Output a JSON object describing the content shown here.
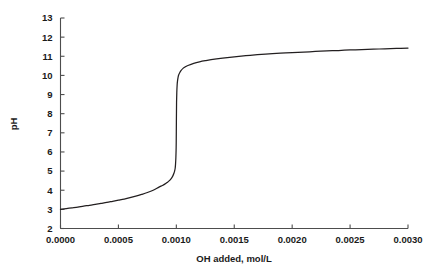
{
  "chart_data": {
    "type": "line",
    "title": "",
    "subtitle": "",
    "xlabel": "OH added, mol/L",
    "ylabel": "pH",
    "xlim": [
      0.0,
      0.003
    ],
    "ylim": [
      2,
      13
    ],
    "grid": false,
    "legend": null,
    "annotations": [],
    "xticks": [
      0.0,
      0.0005,
      0.001,
      0.0015,
      0.002,
      0.0025,
      0.003
    ],
    "xticklabels": [
      "0.0000",
      "0.0005",
      "0.0010",
      "0.0015",
      "0.0020",
      "0.0025",
      "0.0030"
    ],
    "yticks": [
      2,
      3,
      4,
      5,
      6,
      7,
      8,
      9,
      10,
      11,
      12,
      13
    ],
    "yticklabels": [
      "2",
      "3",
      "4",
      "5",
      "6",
      "7",
      "8",
      "9",
      "10",
      "11",
      "12",
      "13"
    ],
    "series": [
      {
        "name": "titration-curve",
        "color": "#231f20",
        "x": [
          0.0,
          5e-05,
          0.0001,
          0.00015,
          0.0002,
          0.00025,
          0.0003,
          0.00035,
          0.0004,
          0.00045,
          0.0005,
          0.00055,
          0.0006,
          0.00065,
          0.0007,
          0.00075,
          0.0008,
          0.00085,
          0.00088,
          0.0009,
          0.00092,
          0.00094,
          0.00096,
          0.00097,
          0.00098,
          0.000985,
          0.00099,
          0.000993,
          0.000996,
          0.000998,
          0.000999,
          0.001,
          0.001001,
          0.001002,
          0.001004,
          0.001007,
          0.00101,
          0.001015,
          0.00102,
          0.00103,
          0.00104,
          0.00106,
          0.00108,
          0.0011,
          0.00115,
          0.0012,
          0.00125,
          0.0013,
          0.0014,
          0.0015,
          0.0016,
          0.0017,
          0.0018,
          0.0019,
          0.002,
          0.0021,
          0.0022,
          0.0023,
          0.0024,
          0.0025,
          0.0026,
          0.0027,
          0.0028,
          0.0029,
          0.003
        ],
        "y": [
          3.0,
          3.04,
          3.08,
          3.12,
          3.17,
          3.21,
          3.26,
          3.31,
          3.36,
          3.42,
          3.48,
          3.54,
          3.61,
          3.69,
          3.78,
          3.88,
          4.0,
          4.16,
          4.25,
          4.32,
          4.4,
          4.5,
          4.65,
          4.75,
          4.9,
          5.0,
          5.15,
          5.35,
          5.7,
          6.1,
          6.5,
          7.2,
          8.0,
          8.6,
          9.1,
          9.5,
          9.7,
          9.9,
          10.02,
          10.15,
          10.25,
          10.38,
          10.46,
          10.52,
          10.63,
          10.71,
          10.77,
          10.82,
          10.9,
          10.97,
          11.03,
          11.08,
          11.12,
          11.16,
          11.19,
          11.22,
          11.25,
          11.28,
          11.3,
          11.33,
          11.35,
          11.37,
          11.39,
          11.41,
          11.43
        ]
      }
    ]
  },
  "axes": {
    "y_axis_title": "pH",
    "x_axis_title": "OH added, mol/L"
  }
}
